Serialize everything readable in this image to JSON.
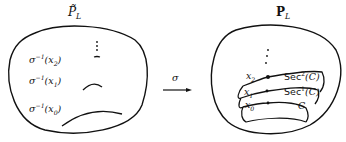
{
  "diagram": {
    "left": {
      "title": "P̃",
      "title_sub": "L",
      "labels": [
        {
          "name": "σ",
          "sup": "−1",
          "arg": "(x",
          "sub": "2",
          "close": ")"
        },
        {
          "name": "σ",
          "sup": "−1",
          "arg": "(x",
          "sub": "1",
          "close": ")"
        },
        {
          "name": "σ",
          "sup": "−1",
          "arg": "(x",
          "sub": "0",
          "close": ")"
        }
      ]
    },
    "arrow": {
      "label": "σ"
    },
    "right": {
      "title": "P",
      "title_sub": "L",
      "points": [
        {
          "base": "x",
          "sub": "2"
        },
        {
          "base": "x",
          "sub": "1"
        },
        {
          "base": "x",
          "sub": "0"
        }
      ],
      "curves": [
        {
          "base": "Sec",
          "sup": "2",
          "arg": "(C)"
        },
        {
          "base": "Sec",
          "sup": "1",
          "arg": "(C)"
        },
        {
          "base": "C"
        }
      ]
    },
    "colors": {
      "ink": "#111111",
      "background": "#ffffff"
    }
  }
}
